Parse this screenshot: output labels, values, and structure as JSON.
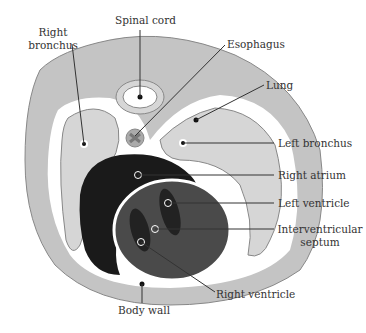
{
  "labels": {
    "spinal_cord": "Spinal cord",
    "right_bronchus_1": "Right",
    "right_bronchus_2": "bronchus",
    "esophagus": "Esophagus",
    "lung": "Lung",
    "left_bronchus": "Left bronchus",
    "right_atrium": "Right atrium",
    "left_ventricle": "Left ventricle",
    "interventricular_1": "Interventricular",
    "interventricular_2": "septum",
    "right_ventricle": "Right ventricle",
    "body_wall": "Body wall"
  },
  "colors": {
    "body": "#c4c4c4",
    "lung": "#d6d6d6",
    "outline": "#888888",
    "atrium": "#1a1a1a",
    "ventricle": "#4a4a4a",
    "ventricle_cavity": "#222222",
    "leader": "#333333"
  }
}
